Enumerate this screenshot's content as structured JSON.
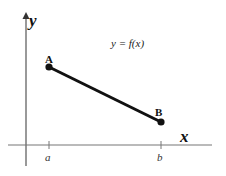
{
  "diagram": {
    "function_label": "y = f(x)",
    "axes": {
      "x_label": "x",
      "y_label": "y"
    },
    "ticks": [
      {
        "label": "a"
      },
      {
        "label": "b"
      }
    ],
    "points": [
      {
        "label": "A"
      },
      {
        "label": "B"
      }
    ],
    "colors": {
      "axis": "#555555",
      "segment": "#111111",
      "text": "#111111"
    }
  }
}
